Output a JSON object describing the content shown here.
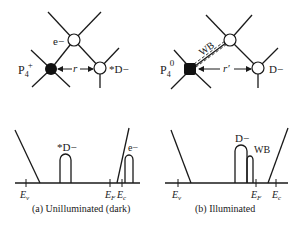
{
  "panel_a": {
    "caption": "(a) Unilluminated (dark)",
    "top": {
      "electron_label": "e−",
      "acceptor_label": "P",
      "acceptor_sub": "4",
      "acceptor_sup": "+",
      "donor_label": "*D−",
      "distance_label": "r"
    },
    "bottom": {
      "ev_label": "E",
      "ev_sub": "v",
      "ef_label": "E",
      "ef_sub": "F",
      "ec_label": "E",
      "ec_sub": "c",
      "donor_state_label": "*D−",
      "electron_state_label": "e−"
    }
  },
  "panel_b": {
    "caption": "(b) Illuminated",
    "top": {
      "bond_label": "WB",
      "acceptor_label": "P",
      "acceptor_sub": "4",
      "acceptor_sup": "0",
      "donor_label": "D−",
      "distance_label": "r′"
    },
    "bottom": {
      "ev_label": "E",
      "ev_sub": "v",
      "ef_label": "E",
      "ef_sub": "F",
      "ec_label": "E",
      "ec_sub": "c",
      "donor_state_label": "D−",
      "wb_state_label": "WB"
    }
  }
}
